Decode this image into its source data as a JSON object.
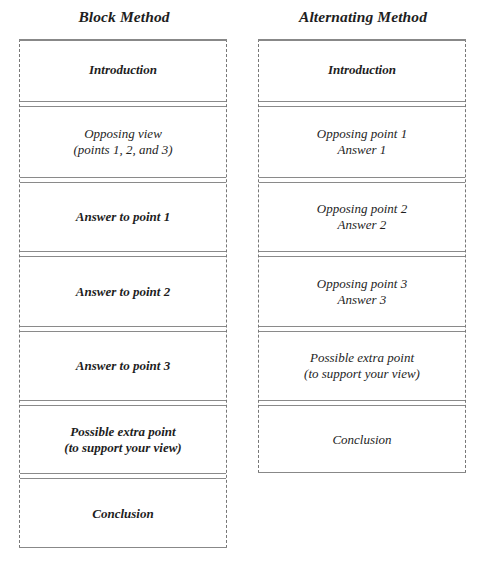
{
  "diagram": {
    "block": {
      "title": "Block Method",
      "boxes": [
        {
          "label": "Introduction",
          "weight": "bold"
        },
        {
          "label": "Opposing view\n(points 1, 2, and 3)",
          "weight": "normal"
        },
        {
          "label": "Answer to point 1",
          "weight": "bold"
        },
        {
          "label": "Answer to point 2",
          "weight": "bold"
        },
        {
          "label": "Answer to point 3",
          "weight": "bold"
        },
        {
          "label": "Possible extra point\n(to support your view)",
          "weight": "bold"
        },
        {
          "label": "Conclusion",
          "weight": "bold"
        }
      ]
    },
    "alternating": {
      "title": "Alternating Method",
      "boxes": [
        {
          "label": "Introduction",
          "weight": "bold"
        },
        {
          "label": "Opposing point 1\nAnswer 1",
          "weight": "normal"
        },
        {
          "label": "Opposing point 2\nAnswer 2",
          "weight": "normal"
        },
        {
          "label": "Opposing point 3\nAnswer 3",
          "weight": "normal"
        },
        {
          "label": "Possible extra  point\n(to support your view)",
          "weight": "normal"
        },
        {
          "label": "Conclusion",
          "weight": "normal"
        }
      ]
    },
    "colors": {
      "border": "#777777",
      "text": "#1e1e1e",
      "background": "#ffffff"
    }
  }
}
